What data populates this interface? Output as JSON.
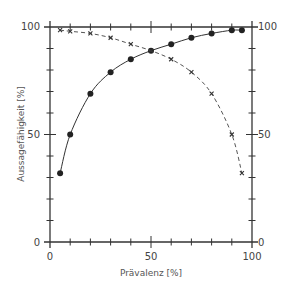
{
  "chart_data": {
    "type": "line",
    "title": "",
    "xlabel": "Prävalenz [%]",
    "ylabel": "Aussagefähigkeit [%]",
    "xlim": [
      0,
      100
    ],
    "ylim": [
      0,
      100
    ],
    "x_ticks": [
      0,
      50,
      100
    ],
    "y_ticks_left": [
      0,
      50,
      100
    ],
    "y_ticks_right": [
      0,
      50,
      100
    ],
    "grid": false,
    "legend": null,
    "series": [
      {
        "name": "solid-dots",
        "style": "solid",
        "marker": "filled-circle",
        "x": [
          5,
          10,
          20,
          30,
          40,
          50,
          60,
          70,
          80,
          90,
          95
        ],
        "y": [
          32,
          50,
          69,
          79,
          85,
          89,
          92,
          95,
          97,
          98.5,
          98.5
        ]
      },
      {
        "name": "dashed-crosses",
        "style": "dashed",
        "marker": "x",
        "x": [
          5,
          10,
          20,
          30,
          40,
          50,
          60,
          70,
          80,
          90,
          95
        ],
        "y": [
          98.5,
          98,
          97,
          95,
          92,
          89,
          85,
          79,
          69,
          50,
          32
        ]
      }
    ]
  },
  "labels": {
    "x_0": "0",
    "x_50": "50",
    "x_100": "100",
    "yl_0": "0",
    "yl_50": "50",
    "yl_100": "100",
    "yr_0": "0",
    "yr_50": "50",
    "yr_100": "100",
    "xlabel": "Prävalenz [%]",
    "ylabel": "Aussagefähigkeit [%]"
  },
  "colors": {
    "ink": "#333333",
    "background": "#ffffff"
  }
}
